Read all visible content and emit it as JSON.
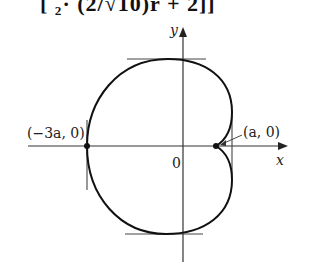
{
  "header_fragment": {
    "text": "[   ₂·        (2/√10)r + 2]]"
  },
  "figure": {
    "type": "cardioid polar curve",
    "axes": {
      "x_label": "x",
      "y_label": "y",
      "origin_label": "0"
    },
    "points": [
      {
        "label": "(−3a, 0)",
        "role": "leftmost point"
      },
      {
        "label": "(a, 0)",
        "role": "cusp"
      }
    ],
    "tangent_lines": [
      "top horizontal",
      "bottom horizontal",
      "left vertical",
      "right vertical"
    ]
  }
}
